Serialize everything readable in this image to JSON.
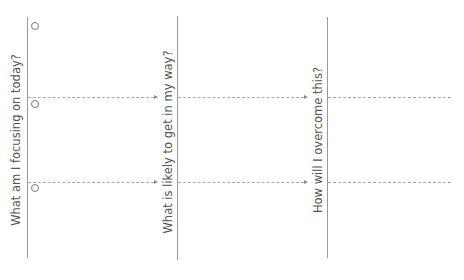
{
  "diagram": {
    "columns": [
      {
        "label": "What am I focusing on today?",
        "label_x": 16,
        "label_y": 140,
        "line_x": 27
      },
      {
        "label": "What is likely to get in my way?",
        "label_x": 168,
        "label_y": 142,
        "line_x": 177
      },
      {
        "label": "How will I overcome this?",
        "label_x": 318,
        "label_y": 140,
        "line_x": 327
      }
    ],
    "rows_y": [
      97,
      182
    ],
    "checkbox_count": 3,
    "colors": {
      "line": "#9a9a9a",
      "dash": "#a8a8a8",
      "text": "#555555"
    }
  }
}
